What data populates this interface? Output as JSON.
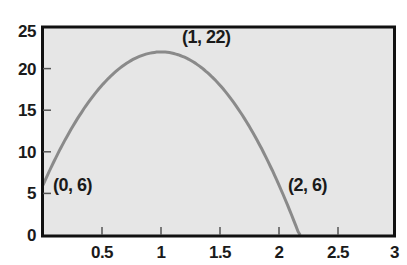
{
  "chart_data": {
    "type": "line",
    "title": "",
    "xlabel": "",
    "ylabel": "",
    "xlim": [
      0,
      3
    ],
    "ylim": [
      0,
      25
    ],
    "grid": false,
    "legend": null,
    "function": "f(x) = -16x^2 + 32x + 6",
    "x_ticks": [
      {
        "value": 0.5,
        "label": "0.5"
      },
      {
        "value": 1,
        "label": "1"
      },
      {
        "value": 1.5,
        "label": "1.5"
      },
      {
        "value": 2,
        "label": "2"
      },
      {
        "value": 2.5,
        "label": "2.5"
      },
      {
        "value": 3,
        "label": "3"
      }
    ],
    "y_ticks": [
      {
        "value": 0,
        "label": "0"
      },
      {
        "value": 5,
        "label": "5"
      },
      {
        "value": 10,
        "label": "10"
      },
      {
        "value": 15,
        "label": "15"
      },
      {
        "value": 20,
        "label": "20"
      },
      {
        "value": 25,
        "label": "25"
      }
    ],
    "series": [
      {
        "name": "parabola",
        "color": "#8a8a8a",
        "x": [
          0,
          0.25,
          0.5,
          0.75,
          1,
          1.25,
          1.5,
          1.75,
          2,
          2.18
        ],
        "values": [
          6,
          13,
          18,
          21,
          22,
          21,
          18,
          13,
          6,
          0
        ]
      }
    ],
    "annotations": [
      {
        "text": "(0, 6)",
        "x": 0,
        "y": 6
      },
      {
        "text": "(1, 22)",
        "x": 1,
        "y": 22
      },
      {
        "text": "(2, 6)",
        "x": 2,
        "y": 6
      }
    ],
    "colors": {
      "plot_background": "#e6e6e6",
      "axis": "#111111",
      "curve": "#8a8a8a",
      "text": "#1a1a1a"
    }
  }
}
